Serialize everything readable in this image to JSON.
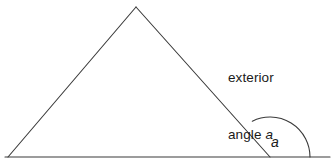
{
  "figure": {
    "type": "geometry-diagram",
    "background_color": "#ffffff",
    "stroke_color": "#3a3a3a",
    "text_color": "#1a1a1a",
    "callout": {
      "line1": "exterior",
      "line2_prefix": "angle ",
      "line2_variable": "a"
    },
    "angle_label": "a",
    "shape": {
      "name": "triangle",
      "apex": {
        "x": 136,
        "y": 7
      },
      "bottom_left": {
        "x": 8,
        "y": 157
      },
      "bottom_right": {
        "x": 270,
        "y": 157
      }
    },
    "baseline": {
      "x_start": 5,
      "x_end": 330,
      "y": 157
    },
    "arc": {
      "center_x": 270,
      "center_y": 157,
      "radius": 40,
      "start_point": {
        "x": 252,
        "y": 121
      },
      "end_point": {
        "x": 310,
        "y": 157
      }
    }
  }
}
